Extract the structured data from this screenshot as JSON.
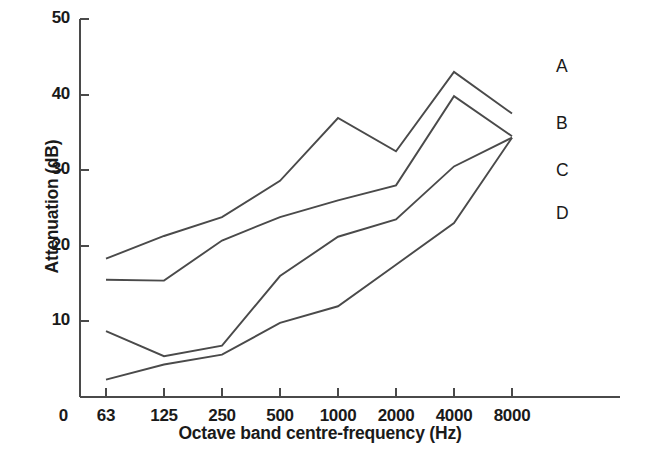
{
  "chart_data": {
    "type": "line",
    "title": "",
    "xlabel": "Octave band centre-frequency (Hz)",
    "ylabel": "Attenuation (dB)",
    "categories": [
      "63",
      "125",
      "250",
      "500",
      "1000",
      "2000",
      "4000",
      "8000"
    ],
    "x_axis_tick_labels": [
      "0",
      "63",
      "125",
      "250",
      "500",
      "1000",
      "2000",
      "4000",
      "8000"
    ],
    "y_axis_tick_labels": [
      "0",
      "10",
      "20",
      "30",
      "40",
      "50"
    ],
    "y_ticks": [
      0,
      10,
      20,
      30,
      40,
      50
    ],
    "ylim": [
      0,
      50
    ],
    "grid": false,
    "legend_position": "right-inline-labels",
    "series": [
      {
        "name": "A",
        "label": "A",
        "color": "#4a4a4a",
        "values": [
          18.3,
          21.3,
          23.8,
          28.6,
          36.9,
          32.5,
          43.0,
          37.5
        ]
      },
      {
        "name": "B",
        "label": "B",
        "color": "#4a4a4a",
        "values": [
          15.5,
          15.4,
          20.7,
          23.8,
          26.0,
          28.0,
          39.8,
          34.5
        ]
      },
      {
        "name": "C",
        "label": "C",
        "color": "#4a4a4a",
        "values": [
          8.7,
          5.4,
          6.8,
          16.0,
          21.2,
          23.5,
          30.5,
          34.3
        ]
      },
      {
        "name": "D",
        "label": "D",
        "color": "#4a4a4a",
        "values": [
          2.3,
          4.3,
          5.6,
          9.8,
          12.0,
          17.5,
          23.0,
          34.3
        ]
      }
    ]
  },
  "axes": {
    "y_title": "Attenuation (dB)",
    "x_title": "Octave band centre-frequency (Hz)",
    "axis_color": "#4a4a4a",
    "text_color": "#1a1a1a"
  },
  "series_labels": {
    "a": "A",
    "b": "B",
    "c": "C",
    "d": "D"
  }
}
